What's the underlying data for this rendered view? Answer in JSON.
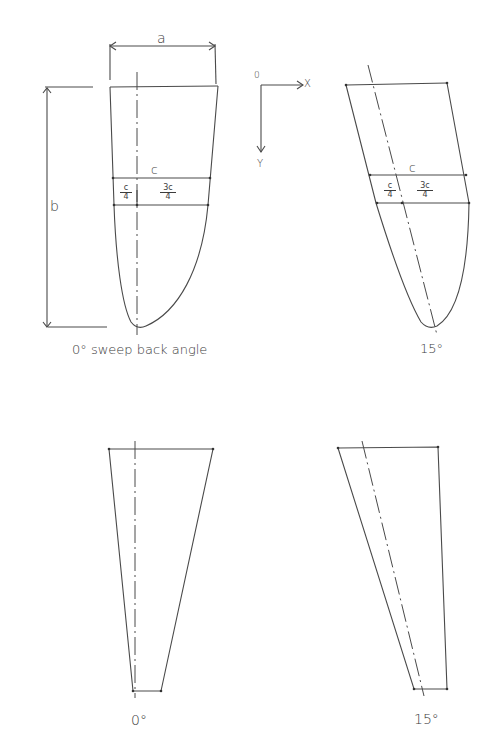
{
  "diagram": {
    "panels": [
      {
        "id": "elliptic-0",
        "caption": "0° sweep back angle",
        "labels": {
          "span_width": "a",
          "span_length": "b",
          "chord": "c",
          "quarter_num": "c",
          "quarter_den": "4",
          "three_quarter_num": "3c",
          "three_quarter_den": "4"
        }
      },
      {
        "id": "elliptic-15",
        "caption": "15°",
        "labels": {
          "chord": "c",
          "quarter_num": "c",
          "quarter_den": "4",
          "three_quarter_num": "3c",
          "three_quarter_den": "4"
        }
      },
      {
        "id": "tapered-0",
        "caption": "0°"
      },
      {
        "id": "tapered-15",
        "caption": "15°"
      }
    ],
    "axes": {
      "origin": "0",
      "x": "X",
      "y": "Y"
    }
  }
}
